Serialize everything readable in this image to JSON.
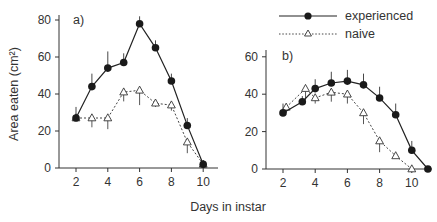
{
  "chart_data": [
    {
      "type": "line",
      "panel": "a)",
      "xlabel": "Days in instar",
      "ylabel": "Area eaten (cm²)",
      "xticks": [
        2,
        4,
        6,
        8,
        10
      ],
      "yticks": [
        0,
        20,
        40,
        60,
        80
      ],
      "xlim": [
        1,
        11
      ],
      "ylim": [
        0,
        82
      ],
      "series": [
        {
          "name": "experienced",
          "marker": "filled-circle",
          "line": "solid",
          "x": [
            2,
            3,
            4,
            5,
            6,
            7,
            8,
            9,
            10
          ],
          "values": [
            27,
            44,
            54,
            57,
            78,
            65,
            47,
            23,
            2
          ],
          "error_up": [
            6,
            7,
            9,
            5,
            4,
            4,
            4,
            4,
            0
          ]
        },
        {
          "name": "naive",
          "marker": "open-triangle",
          "line": "dotted",
          "x": [
            2,
            3,
            4,
            5,
            6,
            7,
            8,
            9,
            10
          ],
          "values": [
            27,
            27,
            27,
            41,
            42,
            35,
            34,
            14,
            2
          ],
          "error_down": [
            0,
            5,
            6,
            5,
            8,
            2,
            3,
            6,
            0
          ]
        }
      ]
    },
    {
      "type": "line",
      "panel": "b)",
      "xlabel": "Days in instar",
      "ylabel": "",
      "xticks": [
        2,
        4,
        6,
        8,
        10
      ],
      "yticks": [
        0,
        20,
        40,
        60
      ],
      "xlim": [
        1,
        11.2
      ],
      "ylim": [
        0,
        65
      ],
      "series": [
        {
          "name": "experienced",
          "marker": "filled-circle",
          "line": "solid",
          "x": [
            2,
            3.2,
            4,
            5,
            6,
            7,
            8,
            9,
            10,
            11
          ],
          "values": [
            30,
            36,
            43,
            46,
            47,
            45,
            38,
            29,
            10,
            0
          ],
          "error_up": [
            5,
            3,
            5,
            6,
            6,
            6,
            6,
            6,
            5,
            0
          ]
        },
        {
          "name": "naive",
          "marker": "open-triangle",
          "line": "dotted",
          "x": [
            2.2,
            3.4,
            4,
            5,
            6,
            7,
            8,
            9,
            10
          ],
          "values": [
            33,
            43,
            38,
            41,
            40,
            30,
            15,
            7,
            0
          ],
          "error_down": [
            3,
            6,
            3,
            5,
            5,
            6,
            6,
            0,
            0
          ]
        }
      ]
    }
  ],
  "legend": {
    "items": [
      {
        "label": "experienced",
        "marker": "filled-circle",
        "line": "solid"
      },
      {
        "label": "naive",
        "marker": "open-triangle",
        "line": "dotted"
      }
    ]
  },
  "labels": {
    "panel_a": "a)",
    "panel_b": "b)",
    "xlabel": "Days in instar",
    "ylabel": "Area eaten (cm²)",
    "legend_experienced": "experienced",
    "legend_naive": "naive"
  }
}
